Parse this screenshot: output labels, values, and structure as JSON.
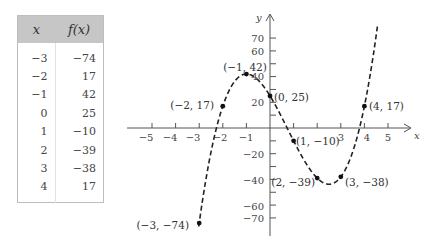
{
  "table": {
    "headers": [
      "x",
      "f(x)"
    ],
    "rows": [
      [
        "−3",
        "−74"
      ],
      [
        "−2",
        "17"
      ],
      [
        "−1",
        "42"
      ],
      [
        "0",
        "25"
      ],
      [
        "1",
        "−10"
      ],
      [
        "2",
        "−39"
      ],
      [
        "3",
        "−38"
      ],
      [
        "4",
        "17"
      ]
    ]
  },
  "chart_data": {
    "type": "line",
    "title": "",
    "function": "f(x) = 4x^3 - 9x^2 - 30x + 25",
    "xlabel": "x",
    "ylabel": "y",
    "x_ticks": [
      -5,
      -4,
      -3,
      -2,
      -1,
      3,
      4,
      5
    ],
    "y_ticks": [
      70,
      60,
      40,
      20,
      -20,
      -40,
      -60,
      -70
    ],
    "xlim": [
      -5.5,
      6
    ],
    "ylim": [
      -80,
      85
    ],
    "grid": false,
    "line_style": "dashed",
    "points": [
      {
        "x": -3,
        "y": -74,
        "label": "(−3, −74)"
      },
      {
        "x": -2,
        "y": 17,
        "label": "(−2, 17)"
      },
      {
        "x": -1,
        "y": 42,
        "label": "(−1, 42)"
      },
      {
        "x": 0,
        "y": 25,
        "label": "(0, 25)"
      },
      {
        "x": 1,
        "y": -10,
        "label": "(1, −10)"
      },
      {
        "x": 2,
        "y": -39,
        "label": "(2, −39)"
      },
      {
        "x": 3,
        "y": -38,
        "label": "(3, −38)"
      },
      {
        "x": 4,
        "y": 17,
        "label": "(4, 17)"
      }
    ]
  },
  "axes": {
    "x_label": "x",
    "y_label": "y",
    "x_tick_labels": [
      "−5",
      "−4",
      "−3",
      "−2",
      "−1",
      "3",
      "4",
      "5"
    ],
    "y_tick_labels": [
      "70",
      "60",
      "40",
      "20",
      "−20",
      "−40",
      "−60",
      "−70"
    ]
  },
  "point_labels": [
    "(−3, −74)",
    "(−2, 17)",
    "(−1, 42)",
    "(0, 25)",
    "(1, −10)",
    "(2, −39)",
    "(3, −38)",
    "(4, 17)"
  ]
}
